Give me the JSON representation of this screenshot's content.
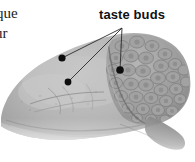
{
  "figure": {
    "background_color": "#ffffff",
    "width": 195,
    "height": 162,
    "label": {
      "text": "taste buds",
      "color": "#111111"
    },
    "caption_fragments": {
      "line1": "que",
      "line2": "ur"
    },
    "leader_lines": {
      "color": "#2b2b2b",
      "converge_point": {
        "x": 122,
        "y": 28
      },
      "dots": [
        {
          "name": "taste-bud-marker-upper-left",
          "x": 62,
          "y": 58,
          "r": 3.6
        },
        {
          "name": "taste-bud-marker-lower-left",
          "x": 68,
          "y": 82,
          "r": 3.4
        },
        {
          "name": "taste-bud-marker-right",
          "x": 120,
          "y": 70,
          "r": 3.8
        }
      ]
    },
    "specimen": {
      "tone_light": "#cfcfcf",
      "tone_mid": "#a8a8a8",
      "tone_dark": "#7e7e7e",
      "tone_shadow": "#5e5e5e",
      "papillae_region": "posterior-right",
      "papillae_count_visible": 34
    }
  }
}
